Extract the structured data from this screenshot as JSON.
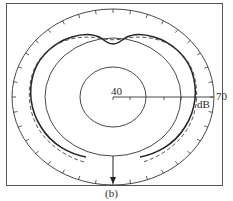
{
  "figure": {
    "caption": "(b)",
    "type": "polar directivity pattern",
    "scale": {
      "inner_label": "40",
      "outer_label": "70",
      "unit_label": "dB"
    },
    "series": [
      {
        "name": "measured",
        "style": "solid"
      },
      {
        "name": "computed",
        "style": "dashed"
      }
    ],
    "colors": {
      "ink": "#2a2a2a",
      "background": "#ffffff"
    }
  }
}
